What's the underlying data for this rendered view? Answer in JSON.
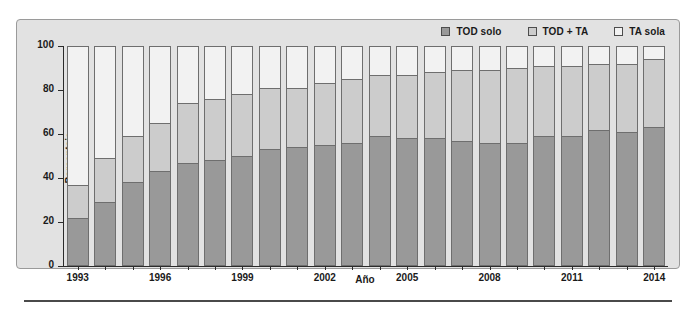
{
  "chart_data": {
    "type": "bar",
    "subtype": "stacked-percentage",
    "title": "",
    "xlabel": "Año",
    "ylabel": "Porcentaje",
    "ylim": [
      0,
      100
    ],
    "yticks": [
      0,
      20,
      40,
      60,
      80,
      100
    ],
    "grid": false,
    "legend_position": "top-right",
    "categories": [
      "1993",
      "1994",
      "1995",
      "1996",
      "1997",
      "1998",
      "1999",
      "2000",
      "2001",
      "2002",
      "2003",
      "2004",
      "2005",
      "2006",
      "2007",
      "2008",
      "2009",
      "2010",
      "2011",
      "2012",
      "2013",
      "2014"
    ],
    "tick_labels": [
      "1993",
      "1996",
      "1999",
      "2002",
      "2005",
      "2008",
      "2011",
      "2014"
    ],
    "series": [
      {
        "name": "TOD solo",
        "color": "#999999",
        "values": [
          22,
          29,
          38,
          43,
          47,
          48,
          50,
          53,
          54,
          55,
          56,
          59,
          58,
          58,
          57,
          56,
          56,
          59,
          59,
          62,
          61,
          63
        ]
      },
      {
        "name": "TOD + TA",
        "color": "#cccccc",
        "values": [
          15,
          20,
          21,
          22,
          27,
          28,
          28,
          28,
          27,
          28,
          29,
          28,
          29,
          30,
          32,
          33,
          34,
          32,
          32,
          30,
          31,
          31
        ]
      },
      {
        "name": "TA sola",
        "color": "#f2f2f2",
        "values": [
          63,
          51,
          41,
          35,
          26,
          24,
          22,
          19,
          19,
          17,
          15,
          13,
          13,
          12,
          11,
          11,
          10,
          9,
          9,
          8,
          8,
          6
        ]
      }
    ],
    "cumulative_tops": {
      "tod_solo_plus_ta": [
        37,
        49,
        59,
        65,
        74,
        76,
        78,
        81,
        81,
        83,
        85,
        87,
        87,
        88,
        89,
        89,
        90,
        91,
        91,
        92,
        92,
        94
      ]
    }
  },
  "legend": {
    "items": [
      {
        "label": "TOD solo",
        "color": "#999999",
        "icon": "square-swatch-icon"
      },
      {
        "label": "TOD + TA",
        "color": "#cccccc",
        "icon": "square-swatch-icon"
      },
      {
        "label": "TA sola",
        "color": "#f2f2f2",
        "icon": "square-swatch-icon"
      }
    ]
  },
  "colors": {
    "panel_background": "#e2e2e2",
    "panel_border": "#9a9a9a",
    "axis": "#2b2b2b",
    "bar_border": "#6e6e6e",
    "text": "#1a1a1a",
    "rule": "#4a4a4a"
  }
}
